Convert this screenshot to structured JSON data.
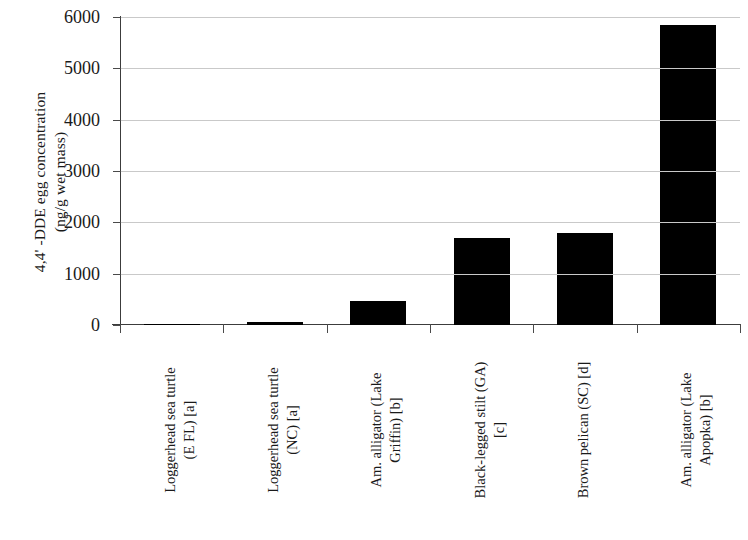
{
  "chart_data": {
    "type": "bar",
    "title": "",
    "subtitle": "",
    "xlabel": "",
    "ylabel": "4,4'-DDE egg concentration (ng/g wet mass)",
    "ylabel_lines": [
      "4,4' -DDE egg concentration",
      "(ng/g wet mass)"
    ],
    "ylim": [
      0,
      6000
    ],
    "ytick_labels": [
      "0",
      "1000",
      "2000",
      "3000",
      "4000",
      "5000",
      "6000"
    ],
    "ytick_values": [
      0,
      1000,
      2000,
      3000,
      4000,
      5000,
      6000
    ],
    "grid": true,
    "grid_axis": "y",
    "legend": false,
    "legend_position": "none",
    "bar_color": "#000000",
    "grid_color": "#c9c9c9",
    "axis_color": "#3c3c3c",
    "categories": [
      "Loggerhead sea turtle (E FL) [a]",
      "Loggerhead sea turtle (NC) [a]",
      "Am. alligator (Lake Griffin) [b]",
      "Black-legged stilt (GA) [c]",
      "Brown pelican (SC) [d]",
      "Am. alligator (Lake Apopka) [b]"
    ],
    "category_lines": [
      [
        "Loggerhead sea turtle",
        "(E FL) [a]"
      ],
      [
        "Loggerhead sea turtle",
        "(NC) [a]"
      ],
      [
        "Am. alligator (Lake",
        "Griffin) [b]"
      ],
      [
        "Black-legged stilt (GA)",
        "[c]"
      ],
      [
        "Brown pelican (SC) [d]",
        ""
      ],
      [
        "Am. alligator (Lake",
        "Apopka) [b]"
      ]
    ],
    "values": [
      5,
      60,
      470,
      1690,
      1800,
      5850
    ]
  }
}
